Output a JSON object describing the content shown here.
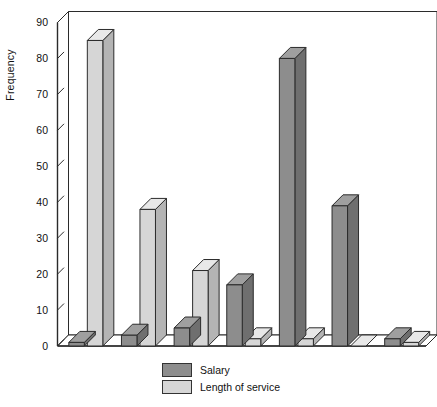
{
  "chart_data": {
    "type": "bar",
    "title": "",
    "subtitle": "",
    "xlabel": "",
    "ylabel": "Frequency",
    "ylim": [
      0,
      90
    ],
    "ytick_step": 10,
    "yticks": [
      0,
      10,
      20,
      30,
      40,
      50,
      60,
      70,
      80,
      90
    ],
    "ytick_labels": [
      "0",
      "10",
      "20",
      "30",
      "40",
      "50",
      "60",
      "70",
      "80",
      "90"
    ],
    "grid": false,
    "xtick_labels": [
      "",
      "",
      "",
      "",
      "",
      "",
      ""
    ],
    "categories": [
      "1",
      "2",
      "3",
      "4",
      "5",
      "6",
      "7"
    ],
    "legend_position": "bottom-center",
    "style": "3d-vertical-bars",
    "series": [
      {
        "name": "Salary",
        "color": "#8d8d8d",
        "values": [
          1,
          3,
          5,
          17,
          80,
          39,
          2
        ]
      },
      {
        "name": "Length of service",
        "color": "#d6d6d6",
        "values": [
          85,
          38,
          21,
          2,
          2,
          0,
          1
        ]
      }
    ]
  },
  "legend": {
    "items": [
      {
        "label": "Salary",
        "color": "#8d8d8d"
      },
      {
        "label": "Length of service",
        "color": "#d6d6d6"
      }
    ]
  },
  "axis": {
    "y_title": "Frequency"
  },
  "colors": {
    "salary": "#8d8d8d",
    "length_of_service": "#d6d6d6",
    "salary_top": "#9f9f9f",
    "salary_side": "#6f6f6f",
    "los_top": "#e8e8e8",
    "los_side": "#b4b4b4",
    "axis": "#2b2b2b",
    "floor": "#ffffff",
    "background": "#ffffff"
  }
}
